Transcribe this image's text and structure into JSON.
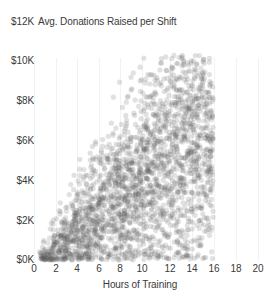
{
  "chart_data": {
    "type": "scatter",
    "title": "Avg. Donations Raised per Shift",
    "xlabel": "Hours of Training",
    "ylabel": "",
    "xlim": [
      0,
      20
    ],
    "ylim": [
      0,
      12000
    ],
    "grid": true,
    "legend": null,
    "marker": {
      "color": "#5a5a5a",
      "opacity": 0.18,
      "size": 2.6,
      "shape": "circle"
    },
    "n_points": 2400,
    "relationship": {
      "form": "linear-positive-heteroscedastic",
      "slope_per_hour": 460,
      "intercept": -250,
      "noise_sd_per_hour": 300
    },
    "x_ticks": [
      {
        "value": 0,
        "label": "0",
        "px": 34
      },
      {
        "value": 2,
        "label": "2",
        "px": 56
      },
      {
        "value": 4,
        "label": "4",
        "px": 77
      },
      {
        "value": 6,
        "label": "6",
        "px": 99
      },
      {
        "value": 8,
        "label": "8",
        "px": 120
      },
      {
        "value": 10,
        "label": "10",
        "px": 142
      },
      {
        "value": 12,
        "label": "12",
        "px": 170
      },
      {
        "value": 14,
        "label": "14",
        "px": 192
      },
      {
        "value": 16,
        "label": "16",
        "px": 214
      },
      {
        "value": 18,
        "label": "18",
        "px": 236
      },
      {
        "value": 20,
        "label": "20",
        "px": 258
      }
    ],
    "y_ticks": [
      {
        "value": 12000,
        "label": "$12K",
        "px": 22
      },
      {
        "value": 10000,
        "label": "$10K",
        "px": 61
      },
      {
        "value": 8000,
        "label": "$8K",
        "px": 101
      },
      {
        "value": 6000,
        "label": "$6K",
        "px": 141
      },
      {
        "value": 4000,
        "label": "$4K",
        "px": 181
      },
      {
        "value": 2000,
        "label": "$2K",
        "px": 221
      },
      {
        "value": 0,
        "label": "$0K",
        "px": 260
      }
    ]
  },
  "colors": {
    "text": "#3a3a3a",
    "background": "#ffffff",
    "grid": "#f2f2f2",
    "point": "#5a5a5a"
  }
}
